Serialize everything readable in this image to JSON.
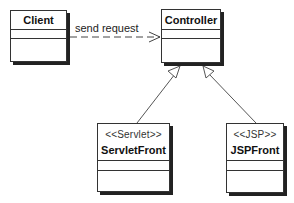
{
  "diagram": {
    "type": "UML class diagram",
    "classes": [
      {
        "id": "client",
        "name": "Client",
        "stereotype": ""
      },
      {
        "id": "controller",
        "name": "Controller",
        "stereotype": ""
      },
      {
        "id": "servlet_front",
        "name": "ServletFront",
        "stereotype": "<<Servlet>>"
      },
      {
        "id": "jsp_front",
        "name": "JSPFront",
        "stereotype": "<<JSP>>"
      }
    ],
    "relations": [
      {
        "from": "client",
        "to": "controller",
        "type": "dependency",
        "label": "send request"
      },
      {
        "from": "servlet_front",
        "to": "controller",
        "type": "generalization",
        "label": ""
      },
      {
        "from": "jsp_front",
        "to": "controller",
        "type": "generalization",
        "label": ""
      }
    ]
  },
  "labels": {
    "client": "Client",
    "controller": "Controller",
    "servlet_stereotype": "<<Servlet>>",
    "servlet_name": "ServletFront",
    "jsp_stereotype": "<<JSP>>",
    "jsp_name": "JSPFront",
    "dependency": "send request"
  },
  "colors": {
    "line": "#333333",
    "shadow": "#222222",
    "background": "#ffffff"
  }
}
